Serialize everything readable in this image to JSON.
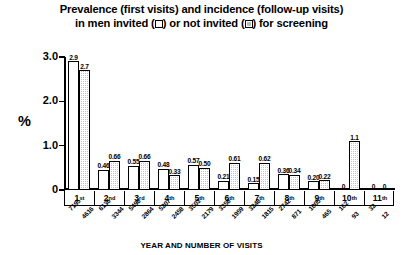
{
  "title": {
    "line1_a": "Prevalence (first visits) and incidence (follow-up visits)",
    "line2_a": "in men invited (",
    "line2_b": ") or not invited (",
    "line2_c": ") for screening",
    "legend_open_name": "open-square-symbol",
    "legend_filled_name": "hatched-square-symbol"
  },
  "chart_data": {
    "type": "bar",
    "xlabel": "YEAR AND NUMBER OF VISITS",
    "ylabel": "%",
    "ylim": [
      0,
      3.0
    ],
    "yticks": [
      "0",
      "1.0",
      "2.0",
      "3.0"
    ],
    "ytick_values": [
      0,
      1.0,
      2.0,
      3.0
    ],
    "grid": false,
    "legend_position": "title",
    "categories": [
      "1st",
      "2nd",
      "3rd",
      "4th",
      "5th",
      "6th",
      "7th",
      "8th",
      "9th",
      "10th",
      "11th"
    ],
    "series": [
      {
        "name": "invited",
        "style": "open",
        "values": [
          2.9,
          0.46,
          0.55,
          0.48,
          0.57,
          0.21,
          0.15,
          0.36,
          0.2,
          0,
          0
        ],
        "labels": [
          "2.9",
          "0.46",
          "0.55",
          "0.48",
          "0.57",
          "0.21",
          "0.15",
          "0.36",
          "0.20",
          "0",
          "0"
        ],
        "counts": [
          7195,
          6136,
          5498,
          5207,
          3503,
          3358,
          3248,
          2742,
          1005,
          162,
          32
        ]
      },
      {
        "name": "not invited",
        "style": "filled",
        "values": [
          2.7,
          0.66,
          0.66,
          0.33,
          0.5,
          0.61,
          0.62,
          0.34,
          0.22,
          1.1,
          0
        ],
        "labels": [
          "2.7",
          "0.66",
          "0.66",
          "0.33",
          "0.50",
          "0.61",
          "0.62",
          "0.34",
          "0.22",
          "1.1",
          "0"
        ],
        "counts": [
          4616,
          3344,
          2864,
          2458,
          2179,
          1959,
          1815,
          871,
          465,
          93,
          12
        ]
      }
    ]
  },
  "axis": {
    "x_title": "YEAR AND NUMBER OF VISITS",
    "y_title": "%"
  }
}
